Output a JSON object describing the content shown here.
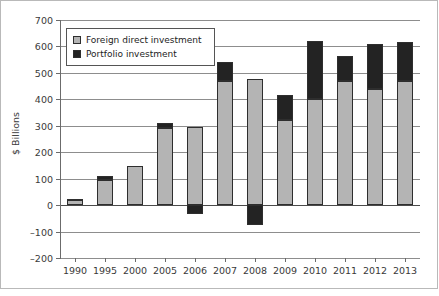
{
  "chart_data": {
    "type": "bar",
    "title": "",
    "subtitle": "",
    "xlabel": "",
    "ylabel": "$ Billions",
    "ylim": [
      -200,
      700
    ],
    "yticks": [
      700,
      600,
      500,
      400,
      300,
      200,
      100,
      0,
      -100,
      -200
    ],
    "grid": true,
    "stacked": true,
    "legend_position": "top-left",
    "categories": [
      "1990",
      "1995",
      "2000",
      "2005",
      "2006",
      "2007",
      "2008",
      "2009",
      "2010",
      "2011",
      "2012",
      "2013"
    ],
    "series": [
      {
        "name": "Foreign direct investment",
        "color": "#b4b4b4",
        "values": [
          18,
          95,
          148,
          290,
          297,
          470,
          478,
          322,
          400,
          470,
          440,
          470
        ]
      },
      {
        "name": "Portfolio investment",
        "color": "#232323",
        "values": [
          5,
          14,
          0,
          22,
          -35,
          70,
          -75,
          96,
          222,
          93,
          168,
          145
        ]
      }
    ],
    "totals": [
      23,
      109,
      148,
      312,
      262,
      540,
      403,
      418,
      622,
      563,
      608,
      615
    ]
  },
  "legend": {
    "entries": [
      {
        "label": "Foreign direct investment",
        "swatch": "fdi"
      },
      {
        "label": "Portfolio investment",
        "swatch": "portfolio"
      }
    ]
  },
  "axes": {
    "y_title": "$ Billions"
  }
}
